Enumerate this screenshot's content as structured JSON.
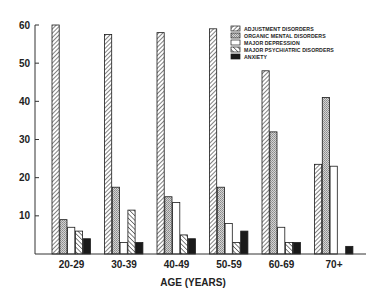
{
  "chart_data": {
    "type": "bar",
    "title": "",
    "xlabel": "AGE (YEARS)",
    "ylabel": "",
    "ylim": [
      0,
      60
    ],
    "yticks": [
      10,
      20,
      30,
      40,
      50,
      60
    ],
    "ytick_labels": [
      "10",
      "20",
      "30",
      "40",
      "50",
      "60"
    ],
    "grid": false,
    "legend_position": "top-right",
    "categories": [
      "20-29",
      "30-39",
      "40-49",
      "50-59",
      "60-69",
      "70+"
    ],
    "series": [
      {
        "name": "ADJUSTMENT DISORDERS",
        "pattern": "diagonal-back",
        "values": [
          60,
          57.5,
          58,
          59,
          48,
          23.5
        ]
      },
      {
        "name": "ORGANIC MENTAL DISORDERS",
        "pattern": "stipple",
        "values": [
          9,
          17.5,
          15,
          17.5,
          32,
          41
        ]
      },
      {
        "name": "MAJOR DEPRESSION",
        "pattern": "white",
        "values": [
          7,
          3,
          13.5,
          8,
          7,
          23
        ]
      },
      {
        "name": "MAJOR PSYCHIATRIC DISORDERS",
        "pattern": "diagonal-forward",
        "values": [
          6,
          11.5,
          5,
          3,
          3,
          0
        ]
      },
      {
        "name": "ANXIETY",
        "pattern": "solid-black",
        "values": [
          4,
          3,
          4,
          6,
          3,
          2
        ]
      }
    ]
  },
  "colors": {
    "ink": "#1a1a1a",
    "stipple": "#bdbdbd",
    "background": "#ffffff"
  }
}
